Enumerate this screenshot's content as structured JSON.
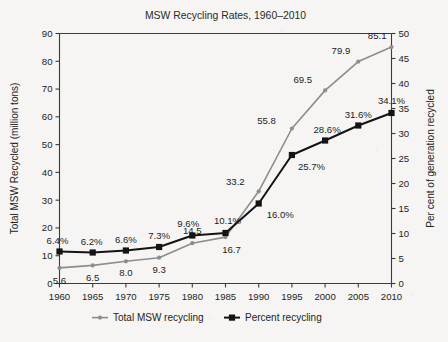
{
  "chart_data": {
    "type": "line",
    "title": "MSW Recycling Rates, 1960–2010",
    "xlabel": "",
    "ylabel": "Total MSW Recycled (million tons)",
    "y2label": "Per cent of generation recycled",
    "categories": [
      "1960",
      "1965",
      "1970",
      "1975",
      "1980",
      "1985",
      "1990",
      "1995",
      "2000",
      "2005",
      "2010"
    ],
    "x": [
      1960,
      1965,
      1970,
      1975,
      1980,
      1985,
      1990,
      1995,
      2000,
      2005,
      2010
    ],
    "ylim": [
      0,
      90
    ],
    "y2lim": [
      0,
      50
    ],
    "yticks": [
      "0",
      "10",
      "20",
      "30",
      "40",
      "50",
      "60",
      "70",
      "80",
      "90"
    ],
    "y2ticks": [
      "0",
      "5",
      "10",
      "15",
      "20",
      "25",
      "30",
      "35",
      "40",
      "45",
      "50"
    ],
    "grid": false,
    "legend_position": "below",
    "series": [
      {
        "name": "Total MSW recycling",
        "axis": "left",
        "color": "#8d8d8d",
        "marker": "circle",
        "values": [
          5.6,
          6.5,
          8.0,
          9.3,
          14.5,
          16.7,
          33.2,
          55.8,
          69.5,
          79.9,
          85.1
        ],
        "labels": [
          "5.6",
          "6.5",
          "8.0",
          "9.3",
          "14.5",
          "16.7",
          "33.2",
          "55.8",
          "69.5",
          "79.9",
          "85.1"
        ]
      },
      {
        "name": "Percent recycling",
        "axis": "right",
        "color": "#141414",
        "marker": "square",
        "values": [
          6.4,
          6.2,
          6.6,
          7.3,
          9.6,
          10.1,
          16.0,
          25.7,
          28.6,
          31.6,
          34.1
        ],
        "labels": [
          "6.4%",
          "6.2%",
          "6.6%",
          "7.3%",
          "9.6%",
          "10.1%",
          "16.0%",
          "25.7%",
          "28.6%",
          "31.6%",
          "34.1%"
        ]
      }
    ]
  },
  "legend": {
    "items": [
      {
        "label": "Total MSW recycling",
        "marker": "circle-marker",
        "color": "#8d8d8d"
      },
      {
        "label": "Percent recycling",
        "marker": "square-marker",
        "color": "#141414"
      }
    ]
  }
}
